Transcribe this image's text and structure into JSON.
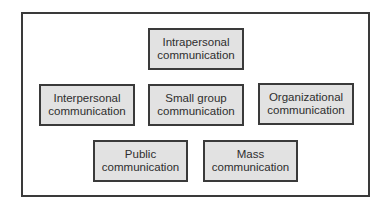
{
  "diagram": {
    "type": "grouped-boxes",
    "nodes": [
      {
        "id": "intrapersonal",
        "label": "Intrapersonal\ncommunication",
        "x": 148,
        "y": 28,
        "w": 96,
        "h": 42
      },
      {
        "id": "interpersonal",
        "label": "Interpersonal\ncommunication",
        "x": 39,
        "y": 84,
        "w": 96,
        "h": 42
      },
      {
        "id": "small-group",
        "label": "Small group\ncommunication",
        "x": 148,
        "y": 84,
        "w": 96,
        "h": 42
      },
      {
        "id": "organizational",
        "label": "Organizational\ncommunication",
        "x": 258,
        "y": 83,
        "w": 96,
        "h": 42
      },
      {
        "id": "public",
        "label": "Public\ncommunication",
        "x": 93,
        "y": 140,
        "w": 95,
        "h": 42
      },
      {
        "id": "mass",
        "label": "Mass\ncommunication",
        "x": 203,
        "y": 140,
        "w": 95,
        "h": 42
      }
    ],
    "edges": []
  },
  "colors": {
    "frame_border": "#3a3a3a",
    "box_fill": "#e2e2e2",
    "box_border": "#3a3a3a",
    "text": "#2e2e2e"
  }
}
